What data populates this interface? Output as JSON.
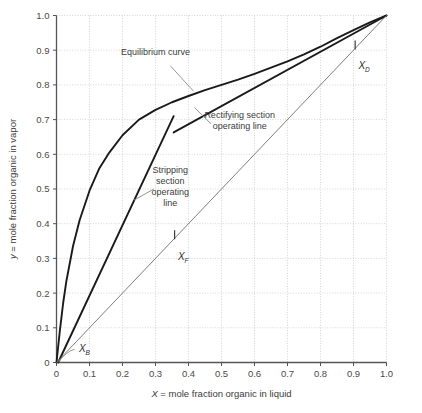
{
  "chart_data": {
    "type": "line",
    "title": "",
    "xlabel": "X = mole fraction organic in liquid",
    "ylabel": "y = mole fraction organic in vapor",
    "xlim": [
      0,
      1.0
    ],
    "ylim": [
      0,
      1.0
    ],
    "grid": true,
    "grid_style": "dotted",
    "legend_position": "none",
    "xticks": [
      "0",
      "0.1",
      "0.2",
      "0.3",
      "0.4",
      "0.5",
      "0.6",
      "0.7",
      "0.8",
      "0.9",
      "1.0"
    ],
    "xtick_values": [
      0,
      0.1,
      0.2,
      0.3,
      0.4,
      0.5,
      0.6,
      0.7,
      0.8,
      0.9,
      1.0
    ],
    "yticks": [
      "0",
      "0.1",
      "0.2",
      "0.3",
      "0.4",
      "0.5",
      "0.6",
      "0.7",
      "0.8",
      "0.9",
      "1.0"
    ],
    "ytick_values": [
      0,
      0.1,
      0.2,
      0.3,
      0.4,
      0.5,
      0.6,
      0.7,
      0.8,
      0.9,
      1.0
    ],
    "series": [
      {
        "name": "Equilibrium curve",
        "style": "thick-solid",
        "color": "#1a1a1a",
        "x": [
          0.0,
          0.01,
          0.02,
          0.03,
          0.05,
          0.07,
          0.1,
          0.13,
          0.16,
          0.2,
          0.25,
          0.3,
          0.35,
          0.4,
          0.45,
          0.5,
          0.55,
          0.6,
          0.65,
          0.7,
          0.75,
          0.8,
          0.85,
          0.9,
          0.95,
          1.0
        ],
        "y": [
          0.0,
          0.09,
          0.17,
          0.235,
          0.335,
          0.41,
          0.495,
          0.56,
          0.605,
          0.655,
          0.7,
          0.728,
          0.75,
          0.768,
          0.785,
          0.8,
          0.815,
          0.832,
          0.85,
          0.868,
          0.888,
          0.91,
          0.935,
          0.958,
          0.98,
          1.0
        ]
      },
      {
        "name": "Rectifying section operating line",
        "style": "thick-solid",
        "color": "#1a1a1a",
        "x": [
          0.355,
          1.0
        ],
        "y": [
          0.663,
          1.0
        ]
      },
      {
        "name": "Stripping section operating line",
        "style": "thick-solid",
        "color": "#1a1a1a",
        "x": [
          0.005,
          0.355
        ],
        "y": [
          0.0,
          0.71
        ]
      },
      {
        "name": "45 degree diagonal",
        "style": "thin-solid",
        "color": "#6e6e6e",
        "x": [
          0.0,
          1.0
        ],
        "y": [
          0.0,
          1.0
        ]
      }
    ],
    "annotations": [
      {
        "name": "equilibrium-curve-label",
        "text": "Equilibrium curve",
        "lines": [
          "Equilibrium curve"
        ],
        "text_x": 0.3,
        "text_y": 0.885,
        "leader_from": [
          0.345,
          0.855
        ],
        "leader_to": [
          0.415,
          0.782
        ]
      },
      {
        "name": "rectifying-line-label",
        "text": "Rectifying section operating line",
        "lines": [
          "Rectifying section",
          "operating line"
        ],
        "text_x": 0.555,
        "text_y": 0.705,
        "leader_from": [
          0.468,
          0.688
        ],
        "leader_to": [
          0.418,
          0.735
        ]
      },
      {
        "name": "stripping-line-label",
        "text": "Stripping section operating line",
        "lines": [
          "Stripping",
          "section",
          "operating",
          "line"
        ],
        "text_x": 0.345,
        "text_y": 0.545,
        "leader_from": [
          0.295,
          0.5
        ],
        "leader_to": [
          0.235,
          0.468
        ]
      }
    ],
    "markers": [
      {
        "name": "xb-marker",
        "label": "X",
        "subscript": "B",
        "point": [
          0.005,
          0.0
        ],
        "leader_to": [
          0.055,
          0.038
        ],
        "label_x": 0.068,
        "label_y": 0.03
      },
      {
        "name": "xf-marker",
        "label": "X",
        "subscript": "F",
        "point": [
          0.358,
          0.358
        ],
        "tick": "vertical",
        "label_x": 0.368,
        "label_y": 0.295
      },
      {
        "name": "xd-marker",
        "label": "X",
        "subscript": "D",
        "point": [
          0.905,
          0.905
        ],
        "tick": "vertical",
        "label_x": 0.915,
        "label_y": 0.845
      }
    ]
  },
  "axes": {
    "x_axis_label": "X = mole fraction organic in liquid",
    "x_axis_label_prefix": "X",
    "x_axis_label_rest": " = mole fraction organic in liquid",
    "y_axis_label": "y = mole fraction organic in vapor",
    "y_axis_label_prefix": "y",
    "y_axis_label_rest": " = mole fraction organic in vapor"
  }
}
